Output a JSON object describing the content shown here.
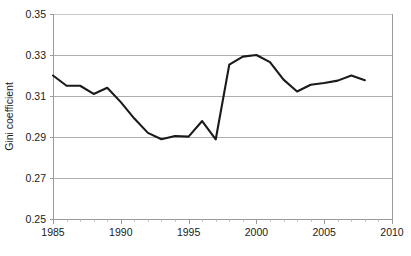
{
  "chart_data": {
    "type": "line",
    "title": "",
    "xlabel": "",
    "ylabel": "Gini coefficient",
    "xlim": [
      1985,
      2010
    ],
    "ylim": [
      0.25,
      0.35
    ],
    "grid": true,
    "legend": "none",
    "x_ticks": [
      "1985",
      "1990",
      "1995",
      "2000",
      "2005",
      "2010"
    ],
    "x_tick_values": [
      1985,
      1990,
      1995,
      2000,
      2005,
      2010
    ],
    "x_minor_tick_step": 1,
    "y_ticks": [
      "0.25",
      "0.27",
      "0.29",
      "0.31",
      "0.33",
      "0.35"
    ],
    "y_tick_values": [
      0.25,
      0.27,
      0.29,
      0.31,
      0.33,
      0.35
    ],
    "x": [
      1985,
      1986,
      1987,
      1988,
      1989,
      1990,
      1991,
      1992,
      1993,
      1994,
      1995,
      1996,
      1997,
      1998,
      1999,
      2000,
      2001,
      2002,
      2003,
      2004,
      2005,
      2006,
      2007,
      2008
    ],
    "series": [
      {
        "name": "Gini coefficient",
        "color": "#1a1a1a",
        "values": [
          0.32,
          0.315,
          0.315,
          0.311,
          0.314,
          0.307,
          0.299,
          0.292,
          0.2889,
          0.2905,
          0.2902,
          0.2978,
          0.2888,
          0.3253,
          0.3292,
          0.33,
          0.3265,
          0.318,
          0.3122,
          0.3155,
          0.3163,
          0.3175,
          0.32,
          0.3177
        ]
      }
    ],
    "annotations": []
  },
  "axis": {
    "y_title": "Gini coefficient"
  },
  "colors": {
    "line": "#1a1a1a",
    "gridline": "#a6a6a6",
    "axis": "#9a9a9a",
    "background": "#ffffff",
    "text": "#1a1a1a"
  }
}
